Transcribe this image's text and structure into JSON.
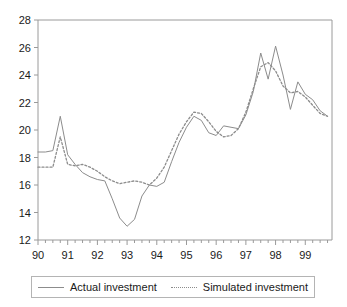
{
  "chart_data": {
    "type": "line",
    "title": "",
    "xlabel": "",
    "ylabel": "",
    "xlim": [
      1990.0,
      1999.9
    ],
    "ylim": [
      12,
      28
    ],
    "ytick_labels": [
      "12",
      "14",
      "16",
      "18",
      "20",
      "22",
      "24",
      "26",
      "28"
    ],
    "ytick_values": [
      12,
      14,
      16,
      18,
      20,
      22,
      24,
      26,
      28
    ],
    "xtick_labels": [
      "90",
      "91",
      "92",
      "93",
      "94",
      "95",
      "96",
      "97",
      "98",
      "99"
    ],
    "xtick_values": [
      1990,
      1991,
      1992,
      1993,
      1994,
      1995,
      1996,
      1997,
      1998,
      1999
    ],
    "minor_ticks_per_year": 4,
    "grid": false,
    "legend_position": "below",
    "colors": {
      "actual": "#8c8c8c",
      "simulated": "#8c8c8c",
      "axis": "#9a9a9a",
      "text": "#1a1a1a"
    },
    "x": [
      1990.0,
      1990.25,
      1990.5,
      1990.75,
      1991.0,
      1991.25,
      1991.5,
      1991.75,
      1992.0,
      1992.25,
      1992.5,
      1992.75,
      1993.0,
      1993.25,
      1993.5,
      1993.75,
      1994.0,
      1994.25,
      1994.5,
      1994.75,
      1995.0,
      1995.25,
      1995.5,
      1995.75,
      1996.0,
      1996.25,
      1996.5,
      1996.75,
      1997.0,
      1997.25,
      1997.5,
      1997.75,
      1998.0,
      1998.25,
      1998.5,
      1998.75,
      1999.0,
      1999.25,
      1999.5,
      1999.75
    ],
    "series": [
      {
        "name": "Actual investment",
        "style": "solid",
        "values": [
          18.4,
          18.4,
          18.5,
          21.0,
          18.2,
          17.5,
          16.9,
          16.6,
          16.4,
          16.3,
          15.0,
          13.6,
          13.0,
          13.5,
          15.2,
          16.0,
          15.9,
          16.2,
          17.7,
          19.1,
          20.2,
          21.0,
          20.7,
          19.8,
          19.6,
          20.3,
          20.2,
          20.1,
          21.1,
          22.8,
          25.6,
          23.7,
          26.1,
          24.0,
          21.5,
          23.5,
          22.6,
          22.2,
          21.4,
          21.0
        ]
      },
      {
        "name": "Simulated investment",
        "style": "dotted",
        "values": [
          17.3,
          17.3,
          17.3,
          19.5,
          17.5,
          17.4,
          17.5,
          17.3,
          17.0,
          16.6,
          16.3,
          16.1,
          16.2,
          16.3,
          16.2,
          16.0,
          16.5,
          17.3,
          18.5,
          19.7,
          20.6,
          21.3,
          21.2,
          20.6,
          19.9,
          19.5,
          19.6,
          20.1,
          21.3,
          23.0,
          24.6,
          24.9,
          24.3,
          23.2,
          22.7,
          22.8,
          22.4,
          21.8,
          21.2,
          21.0
        ]
      }
    ]
  },
  "legend": {
    "items": [
      {
        "label": "Actual investment",
        "style": "solid"
      },
      {
        "label": "Simulated investment",
        "style": "dotted"
      }
    ]
  }
}
